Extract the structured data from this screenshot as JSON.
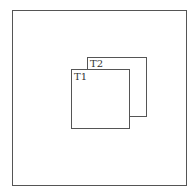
{
  "diagram": {
    "outer": {
      "label": ""
    },
    "windows": [
      {
        "label": "T1"
      },
      {
        "label": "T2"
      }
    ]
  }
}
